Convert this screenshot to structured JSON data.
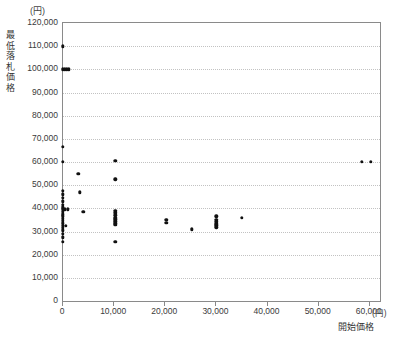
{
  "chart_data": {
    "type": "scatter",
    "title": "",
    "xlabel": "開始価格",
    "ylabel": "最低落札価格",
    "x_unit": "(円)",
    "y_unit": "(円)",
    "xlim": [
      0,
      62000
    ],
    "ylim": [
      0,
      120000
    ],
    "grid": "horizontal-dotted",
    "legend": "none",
    "x_ticks": [
      0,
      10000,
      20000,
      30000,
      40000,
      50000,
      60000
    ],
    "x_tick_labels": [
      "0",
      "10,000",
      "20,000",
      "30,000",
      "40,000",
      "50,000",
      "60,000"
    ],
    "y_ticks": [
      0,
      10000,
      20000,
      30000,
      40000,
      50000,
      60000,
      70000,
      80000,
      90000,
      100000,
      110000,
      120000
    ],
    "y_tick_labels": [
      "0",
      "10,000",
      "20,000",
      "30,000",
      "40,000",
      "50,000",
      "60,000",
      "70,000",
      "80,000",
      "90,000",
      "100,000",
      "110,000",
      "120,000"
    ],
    "marker": "filled-circle",
    "marker_color": "#111111",
    "points": [
      [
        0,
        110000
      ],
      [
        0,
        100000
      ],
      [
        300,
        100000
      ],
      [
        700,
        100000
      ],
      [
        1100,
        100000
      ],
      [
        0,
        66500
      ],
      [
        0,
        60000
      ],
      [
        0,
        47500
      ],
      [
        0,
        46000
      ],
      [
        0,
        44500
      ],
      [
        0,
        43000
      ],
      [
        0,
        41500
      ],
      [
        0,
        40500
      ],
      [
        0,
        39500
      ],
      [
        400,
        39500
      ],
      [
        900,
        39500
      ],
      [
        0,
        38500
      ],
      [
        0,
        37500
      ],
      [
        0,
        36500
      ],
      [
        0,
        35500
      ],
      [
        0,
        34500
      ],
      [
        0,
        33500
      ],
      [
        0,
        32500
      ],
      [
        500,
        32500
      ],
      [
        0,
        31500
      ],
      [
        0,
        30500
      ],
      [
        0,
        29000
      ],
      [
        0,
        27500
      ],
      [
        0,
        25500
      ],
      [
        3000,
        55000
      ],
      [
        3300,
        47000
      ],
      [
        4000,
        38500
      ],
      [
        10200,
        60500
      ],
      [
        10200,
        52500
      ],
      [
        10200,
        39000
      ],
      [
        10200,
        38000
      ],
      [
        10200,
        37000
      ],
      [
        10200,
        36000
      ],
      [
        10200,
        35200
      ],
      [
        10200,
        34400
      ],
      [
        10200,
        33600
      ],
      [
        10200,
        32800
      ],
      [
        10200,
        25500
      ],
      [
        20200,
        35000
      ],
      [
        20200,
        33800
      ],
      [
        25200,
        31000
      ],
      [
        30000,
        36500
      ],
      [
        30000,
        35000
      ],
      [
        30000,
        34200
      ],
      [
        30000,
        33400
      ],
      [
        30000,
        32600
      ],
      [
        30000,
        31800
      ],
      [
        35000,
        36000
      ],
      [
        58500,
        60000
      ],
      [
        60200,
        60000
      ]
    ]
  }
}
